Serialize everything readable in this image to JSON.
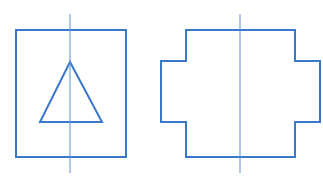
{
  "figure": {
    "stroke_color": "#3a78c8",
    "centerline_color": "#5a8fd6",
    "background": "#ffffff"
  },
  "views": [
    {
      "name": "left-view",
      "shape": "rectangle-with-triangle"
    },
    {
      "name": "right-view",
      "shape": "stepped-cross-outline"
    }
  ]
}
